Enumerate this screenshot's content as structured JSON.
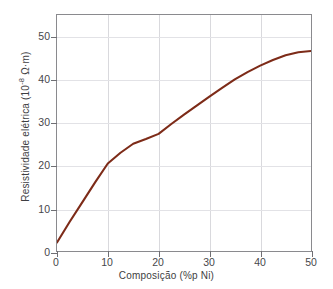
{
  "chart_data": {
    "type": "line",
    "title": "",
    "xlabel": "Composição (%p Ni)",
    "ylabel_text": "Resistividade elétrica (10",
    "ylabel_exponent": "-8",
    "ylabel_tail": " Ω·m)",
    "ylabel_full": "Resistividade elétrica (10-8 Ω·m)",
    "xlim": [
      0,
      50
    ],
    "ylim": [
      0,
      55
    ],
    "xticks": [
      0,
      10,
      20,
      30,
      40,
      50
    ],
    "xtick_labels": [
      "0",
      "10",
      "20",
      "30",
      "40",
      "50"
    ],
    "yticks": [
      0,
      10,
      20,
      30,
      40,
      50
    ],
    "ytick_labels": [
      "0",
      "10",
      "20",
      "30",
      "40",
      "50"
    ],
    "grid": "both-light",
    "legend": "none",
    "series": [
      {
        "name": "Cu-Ni resistivity",
        "color": "#7d2b18",
        "x": [
          0,
          2.5,
          5,
          7.5,
          10,
          12.5,
          15,
          17.5,
          20,
          22.5,
          25,
          27.5,
          30,
          32.5,
          35,
          37.5,
          40,
          42.5,
          45,
          47.5,
          50
        ],
        "y": [
          2.0,
          6.8,
          11.4,
          16.0,
          20.4,
          22.9,
          25.0,
          26.1,
          27.3,
          29.6,
          31.8,
          33.9,
          36.0,
          38.0,
          40.0,
          41.7,
          43.2,
          44.5,
          45.6,
          46.3,
          46.6
        ]
      }
    ]
  },
  "axes": {
    "x_tick_count": 6,
    "y_tick_count": 6
  }
}
